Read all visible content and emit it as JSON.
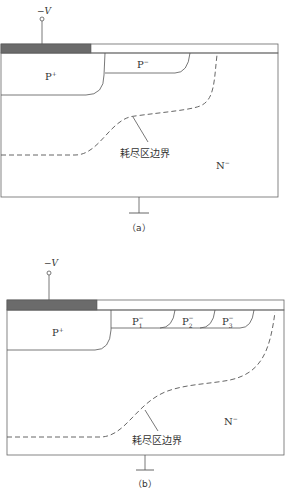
{
  "colors": {
    "line": "#555555",
    "metal": "#6b6b6b",
    "text": "#333333",
    "background": "#ffffff"
  },
  "diagram_a": {
    "terminal_label": "−V",
    "p_plus_label": "P",
    "p_plus_sup": "+",
    "p_minus_label": "P",
    "p_minus_sup": "−",
    "n_minus_label": "N",
    "n_minus_sup": "−",
    "depletion_label": "耗尽区边界",
    "caption": "（a）"
  },
  "diagram_b": {
    "terminal_label": "−V",
    "p_plus_label": "P",
    "p_plus_sup": "+",
    "rings": [
      {
        "label": "P",
        "sub": "1",
        "sup": "−"
      },
      {
        "label": "P",
        "sub": "2",
        "sup": "−"
      },
      {
        "label": "P",
        "sub": "3",
        "sup": "−"
      }
    ],
    "n_minus_label": "N",
    "n_minus_sup": "−",
    "depletion_label": "耗尽区边界",
    "caption": "（b）"
  }
}
